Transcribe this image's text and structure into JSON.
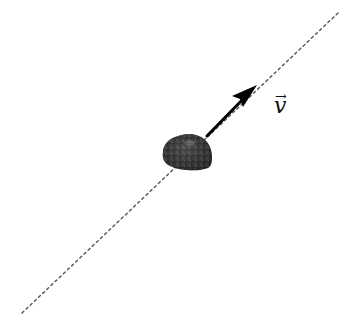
{
  "diagram": {
    "trajectory": {
      "style": "dotted",
      "color": "#555555",
      "start": [
        22,
        313
      ],
      "end": [
        338,
        13
      ]
    },
    "object": {
      "name": "rock",
      "color": "#3a3a3a",
      "center": [
        187,
        153
      ]
    },
    "velocity_arrow": {
      "color": "#000000",
      "start": [
        207,
        136
      ],
      "end": [
        256,
        86
      ]
    },
    "label": {
      "symbol": "v",
      "accent": "→",
      "position": [
        276,
        98
      ]
    }
  }
}
